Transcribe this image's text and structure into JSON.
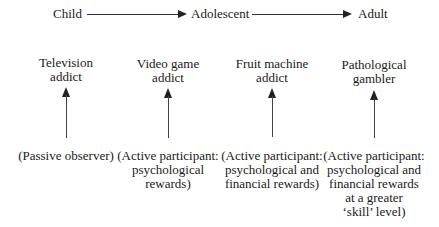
{
  "timeline": {
    "stages": [
      "Child",
      "Adolescent",
      "Adult"
    ]
  },
  "columns": [
    {
      "title_lines": [
        "Television",
        "addict"
      ],
      "desc_lines": [
        "(Passive observer)"
      ]
    },
    {
      "title_lines": [
        "Video game",
        "addict"
      ],
      "desc_lines": [
        "(Active participant:",
        "psychological",
        "rewards)"
      ]
    },
    {
      "title_lines": [
        "Fruit machine",
        "addict"
      ],
      "desc_lines": [
        "(Active participant:",
        "psychological and",
        "financial rewards)"
      ]
    },
    {
      "title_lines": [
        "Pathological",
        "gambler"
      ],
      "desc_lines": [
        "(Active participant:",
        "psychological and",
        "financial rewards",
        "at a greater",
        "‘skill’ level)"
      ]
    }
  ]
}
